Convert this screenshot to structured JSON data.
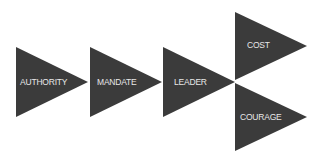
{
  "diagram": {
    "fill_color": "#3b3b3b",
    "text_color": "#e8e8e8",
    "background": "#ffffff",
    "nodes": [
      {
        "id": "authority",
        "label": "AUTHORITY"
      },
      {
        "id": "mandate",
        "label": "MANDATE"
      },
      {
        "id": "leader",
        "label": "LEADER"
      },
      {
        "id": "cost",
        "label": "COST"
      },
      {
        "id": "courage",
        "label": "COURAGE"
      }
    ],
    "flow": [
      "AUTHORITY",
      "MANDATE",
      "LEADER",
      [
        "COST",
        "COURAGE"
      ]
    ]
  }
}
